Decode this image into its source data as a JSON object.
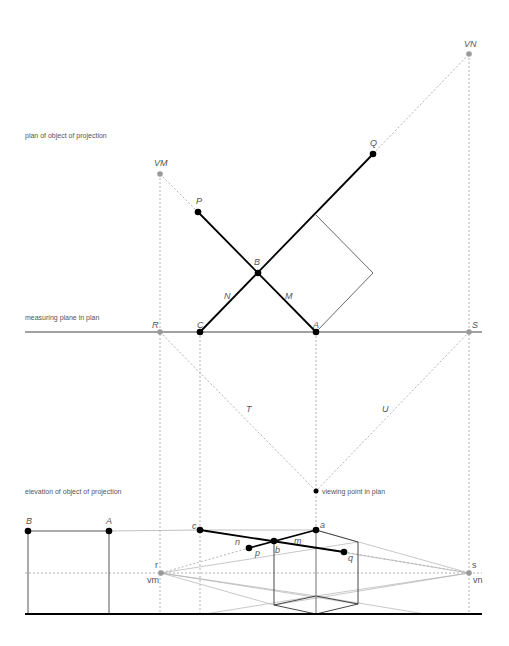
{
  "section_labels": {
    "plan": "plan of object of projection",
    "measuring_plane": "measuring plane in plan",
    "elevation": "elevation of object of projection",
    "viewing_point": "viewing point in plan"
  },
  "plan_points": {
    "VN": "VN",
    "VM": "VM",
    "Q": "Q",
    "P": "P",
    "B": "B",
    "N": "N",
    "M": "M",
    "R": "R",
    "C": "C",
    "A": "A",
    "S": "S",
    "T": "T",
    "U": "U"
  },
  "elevation_points": {
    "B": "B",
    "A": "A",
    "c": "c",
    "a": "a",
    "n": "n",
    "m": "m",
    "p": "p",
    "b": "b",
    "q": "q",
    "r": "r",
    "vm": "vm",
    "s": "s",
    "vn": "vn"
  },
  "colors": {
    "solid": "#000000",
    "construction": "#9a9a9a",
    "vanishing_point": "#9a9a9a",
    "label": "#555555"
  }
}
